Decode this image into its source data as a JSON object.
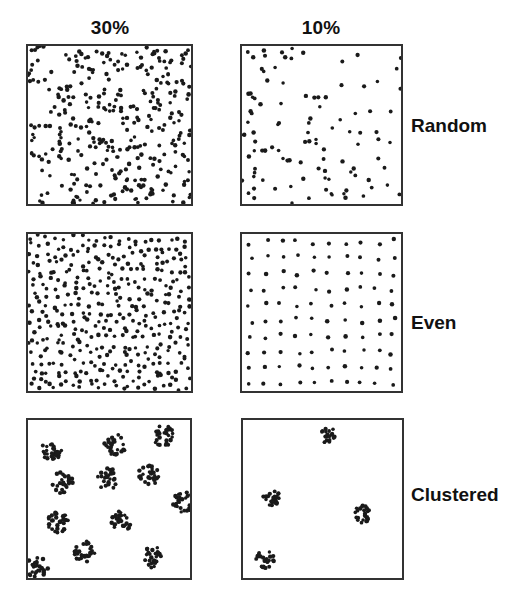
{
  "figure": {
    "columns": [
      {
        "label": "30%",
        "key": "high"
      },
      {
        "label": "10%",
        "key": "low"
      }
    ],
    "rows": [
      {
        "label": "Random",
        "key": "random"
      },
      {
        "label": "Even",
        "key": "even"
      },
      {
        "label": "Clustered",
        "key": "clustered"
      }
    ],
    "dot_color": "#1a1a1a",
    "border_color": "#333333",
    "panels": [
      {
        "row": "random",
        "column": "30%",
        "pattern": "random",
        "count": 330,
        "seed": 11
      },
      {
        "row": "random",
        "column": "10%",
        "pattern": "random",
        "count": 105,
        "seed": 23
      },
      {
        "row": "even",
        "column": "30%",
        "pattern": "even",
        "grid": [
          20,
          19
        ],
        "jitter": 0.45,
        "seed": 37
      },
      {
        "row": "even",
        "column": "10%",
        "pattern": "even",
        "grid": [
          10,
          10
        ],
        "jitter": 0.18,
        "seed": 41
      },
      {
        "row": "clustered",
        "column": "30%",
        "pattern": "clustered",
        "per_cluster": 28,
        "spread": 11,
        "seed": 53,
        "cluster_centers": [
          [
            24,
            30
          ],
          [
            87,
            25
          ],
          [
            136,
            16
          ],
          [
            34,
            63
          ],
          [
            80,
            59
          ],
          [
            120,
            55
          ],
          [
            156,
            82
          ],
          [
            30,
            102
          ],
          [
            94,
            102
          ],
          [
            9,
            147
          ],
          [
            57,
            132
          ],
          [
            126,
            137
          ]
        ]
      },
      {
        "row": "clustered",
        "column": "10%",
        "pattern": "clustered",
        "per_cluster": 22,
        "spread": 9,
        "seed": 67,
        "cluster_centers": [
          [
            84,
            15
          ],
          [
            28,
            77
          ],
          [
            119,
            94
          ],
          [
            22,
            139
          ]
        ]
      }
    ]
  }
}
